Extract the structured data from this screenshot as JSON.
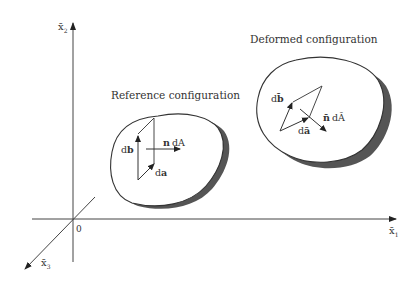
{
  "axes": {
    "x1_label": "x̄",
    "x1_sub": "1",
    "x2_label": "x̄",
    "x2_sub": "2",
    "x3_label": "x̄",
    "x3_sub": "3",
    "origin": "0"
  },
  "reference": {
    "title": "Reference configuration",
    "db": "db",
    "da": "da",
    "normal": "n",
    "area": "dA"
  },
  "deformed": {
    "title": "Deformed configuration",
    "db": "db̄",
    "da": "dā",
    "normal": "n̄",
    "area": "dĀ"
  },
  "colors": {
    "line": "#333333",
    "shadow": "#555555",
    "fill": "#ffffff"
  }
}
